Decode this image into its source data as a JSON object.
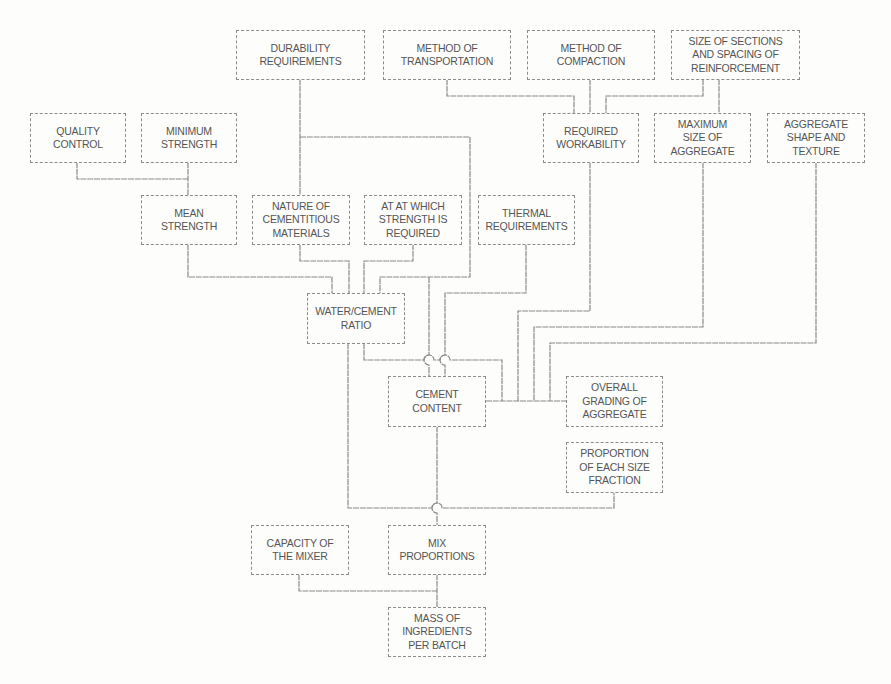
{
  "diagram": {
    "colors": {
      "line": "#8a8a8a",
      "text": "#555555",
      "background": "#fdfdfc"
    },
    "nodes": {
      "durability": {
        "label": "DURABILITY\nREQUIREMENTS"
      },
      "transportation": {
        "label": "METHOD OF\nTRANSPORTATION"
      },
      "compaction": {
        "label": "METHOD OF\nCOMPACTION"
      },
      "size_sections": {
        "label": "SIZE OF SECTIONS\nAND SPACING OF\nREINFORCEMENT"
      },
      "quality_control": {
        "label": "QUALITY\nCONTROL"
      },
      "minimum_strength": {
        "label": "MINIMUM\nSTRENGTH"
      },
      "required_workability": {
        "label": "REQUIRED\nWORKABILITY"
      },
      "max_aggregate_size": {
        "label": "MAXIMUM\nSIZE OF\nAGGREGATE"
      },
      "aggregate_shape": {
        "label": "AGGREGATE\nSHAPE AND\nTEXTURE"
      },
      "mean_strength": {
        "label": "MEAN\nSTRENGTH"
      },
      "cementitious_materials": {
        "label": "NATURE OF\nCEMENTITIOUS\nMATERIALS"
      },
      "age_strength": {
        "label": "AT AT WHICH\nSTRENGTH IS\nREQUIRED"
      },
      "thermal": {
        "label": "THERMAL\nREQUIREMENTS"
      },
      "water_cement_ratio": {
        "label": "WATER/CEMENT\nRATIO"
      },
      "cement_content": {
        "label": "CEMENT\nCONTENT"
      },
      "overall_grading": {
        "label": "OVERALL\nGRADING OF\nAGGREGATE"
      },
      "size_fraction": {
        "label": "PROPORTION\nOF EACH SIZE\nFRACTION"
      },
      "mixer_capacity": {
        "label": "CAPACITY OF\nTHE MIXER"
      },
      "mix_proportions": {
        "label": "MIX\nPROPORTIONS"
      },
      "batch_mass": {
        "label": "MASS OF\nINGREDIENTS\nPER BATCH"
      }
    },
    "edges": [
      [
        "quality_control",
        "mean_strength"
      ],
      [
        "minimum_strength",
        "mean_strength"
      ],
      [
        "mean_strength",
        "water_cement_ratio"
      ],
      [
        "cementitious_materials",
        "water_cement_ratio"
      ],
      [
        "age_strength",
        "water_cement_ratio"
      ],
      [
        "durability",
        "cementitious_materials"
      ],
      [
        "durability",
        "water_cement_ratio"
      ],
      [
        "durability",
        "cement_content"
      ],
      [
        "thermal",
        "cement_content"
      ],
      [
        "transportation",
        "required_workability"
      ],
      [
        "compaction",
        "required_workability"
      ],
      [
        "size_sections",
        "required_workability"
      ],
      [
        "size_sections",
        "max_aggregate_size"
      ],
      [
        "required_workability",
        "overall_grading"
      ],
      [
        "max_aggregate_size",
        "overall_grading"
      ],
      [
        "aggregate_shape",
        "overall_grading"
      ],
      [
        "water_cement_ratio",
        "overall_grading"
      ],
      [
        "cement_content",
        "overall_grading"
      ],
      [
        "water_cement_ratio",
        "mix_proportions"
      ],
      [
        "size_fraction",
        "mix_proportions"
      ],
      [
        "cement_content",
        "mix_proportions"
      ],
      [
        "mixer_capacity",
        "batch_mass"
      ],
      [
        "mix_proportions",
        "batch_mass"
      ]
    ]
  }
}
